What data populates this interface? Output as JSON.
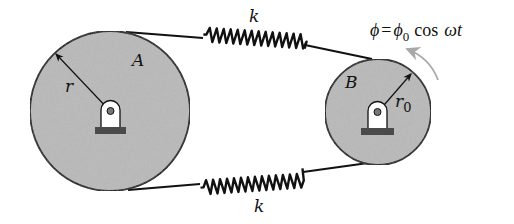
{
  "diagram": {
    "disk_a": {
      "label": "A",
      "radius_label": "r",
      "center": [
        110,
        111
      ],
      "radius": 80
    },
    "disk_b": {
      "label": "B",
      "radius_label": "r",
      "radius_subscript": "0",
      "center": [
        378,
        112
      ],
      "radius": 53
    },
    "spring_top": {
      "label": "k"
    },
    "spring_bottom": {
      "label": "k"
    },
    "excitation": {
      "phi": "ϕ",
      "equals": "=",
      "phi0": "ϕ",
      "phi0_sub": "0",
      "cos": "cos",
      "omega_t": "ωt"
    },
    "colors": {
      "disk_fill": "#b9b9b9",
      "stroke": "#111111",
      "base": "#4a4a4a",
      "arrow_grey": "#a8a8a8"
    }
  }
}
